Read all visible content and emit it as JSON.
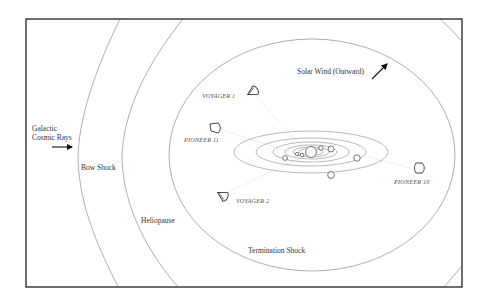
{
  "diagram": {
    "boundaries": [
      {
        "id": "bow-shock",
        "label": "Bow Shock"
      },
      {
        "id": "heliopause",
        "label": "Heliopause"
      },
      {
        "id": "termination-shock",
        "label": "Termination Shock"
      }
    ],
    "flows": {
      "cosmic_rays": {
        "line1": "Galactic",
        "line2": "Cosmic Rays",
        "direction": "right"
      },
      "solar_wind": {
        "label": "Solar Wind (Outward)",
        "direction": "up-right"
      }
    },
    "spacecraft": [
      {
        "id": "voyager-1",
        "label": "VOYAGER 1"
      },
      {
        "id": "pioneer-11",
        "label": "PIONEER 11"
      },
      {
        "id": "voyager-2",
        "label": "VOYAGER 2"
      },
      {
        "id": "pioneer-10",
        "label": "PIONEER 10"
      }
    ],
    "solar_system": {
      "sun": "Sun",
      "planet_count": 8
    },
    "colors": {
      "frame": "#222222",
      "curves": "#9a9a9a",
      "text": "#333333"
    }
  }
}
